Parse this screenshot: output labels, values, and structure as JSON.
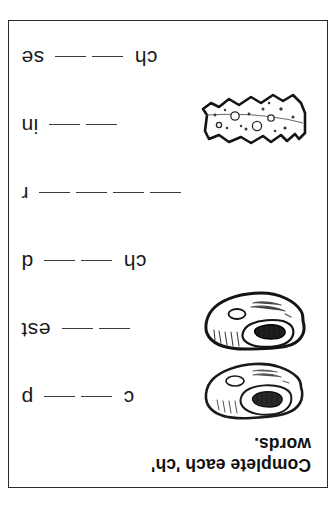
{
  "worksheet": {
    "title_line1": "Complete each 'ch'",
    "title_line2": "words.",
    "orientation": "upside-down",
    "page_border_color": "#2b2b2b",
    "text_color": "#111111",
    "blank_line_color": "#3a3a3a",
    "rows": [
      {
        "id": "row-chop",
        "prefix_letters": "c",
        "blanks": 2,
        "suffix_letters": "p",
        "illustration": "pork-chop-illustration",
        "has_illustration": true
      },
      {
        "id": "row-chest",
        "prefix_letters": "",
        "blanks": 2,
        "suffix_letters": "est",
        "illustration": "treasure-chest-illustration",
        "has_illustration": true
      },
      {
        "id": "row-child",
        "prefix_letters": "ch",
        "blanks": 2,
        "suffix_letters": "d",
        "illustration": "",
        "has_illustration": false
      },
      {
        "id": "row-chair",
        "prefix_letters": "",
        "blanks": 4,
        "suffix_letters": "r",
        "illustration": "",
        "has_illustration": false
      },
      {
        "id": "row-chin",
        "prefix_letters": "",
        "blanks": 2,
        "suffix_letters": "in",
        "illustration": "cheese-wedge-illustration",
        "has_illustration": true
      },
      {
        "id": "row-cheese",
        "prefix_letters": "ch",
        "blanks": 2,
        "suffix_letters": "se",
        "illustration": "",
        "has_illustration": false
      }
    ]
  }
}
